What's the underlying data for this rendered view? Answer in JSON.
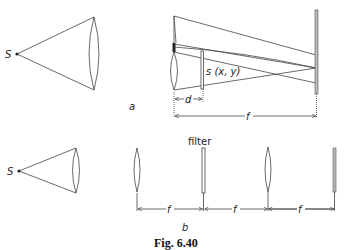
{
  "figure": {
    "caption": "Fig. 6.40",
    "panel_a": {
      "label": "a",
      "source_label": "S",
      "object_label": "s (x, y)",
      "dimension_d": "d",
      "dimension_f": "f"
    },
    "panel_b": {
      "label": "b",
      "source_label": "S",
      "filter_label": "filter",
      "dimension_f1": "f",
      "dimension_f2": "f",
      "dimension_f3": "f"
    }
  }
}
